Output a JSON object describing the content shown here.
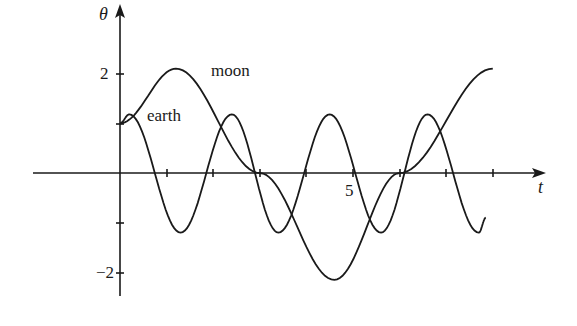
{
  "chart_data": {
    "type": "line",
    "title": "",
    "xlabel": "t",
    "ylabel": "θ",
    "xlim": [
      -1.9,
      9.2
    ],
    "ylim": [
      -2.5,
      2.9
    ],
    "grid": false,
    "legend": "inline labels",
    "x_tick_positions": [
      1,
      2,
      3,
      4,
      5,
      6,
      7,
      8
    ],
    "x_tick_labels": {
      "5": "5"
    },
    "y_tick_positions": [
      -2,
      -1,
      1,
      2
    ],
    "y_tick_labels": {
      "2": "2",
      "-2": "−2"
    },
    "series": [
      {
        "name": "moon",
        "t_range": [
          0,
          8.0
        ],
        "description": "slow oscillation, amplitude ≈2.15, period ≈7.4",
        "points": [
          [
            0,
            1.0
          ],
          [
            1.2,
            2.1
          ],
          [
            3.0,
            0
          ],
          [
            4.6,
            -2.15
          ],
          [
            6.0,
            0
          ],
          [
            8.0,
            2.1
          ]
        ]
      },
      {
        "name": "earth",
        "t_range": [
          0,
          7.85
        ],
        "description": "fast oscillation, amplitude ≈1.2, period ≈2.15",
        "points": [
          [
            0,
            1.0
          ],
          [
            0.2,
            1.18
          ],
          [
            1.3,
            -1.2
          ],
          [
            2.4,
            1.18
          ],
          [
            3.4,
            -1.2
          ],
          [
            4.5,
            1.18
          ],
          [
            5.6,
            -1.2
          ],
          [
            6.6,
            1.18
          ],
          [
            7.7,
            -1.2
          ],
          [
            7.85,
            -0.9
          ]
        ]
      }
    ],
    "annotations": [
      {
        "text": "moon",
        "near": "moon curve peak"
      },
      {
        "text": "earth",
        "near": "earth first peak"
      }
    ]
  },
  "labels": {
    "y_axis": "θ",
    "x_axis": "t",
    "tick_2": "2",
    "tick_neg2": "−2",
    "tick_5": "5",
    "moon": "moon",
    "earth": "earth"
  }
}
